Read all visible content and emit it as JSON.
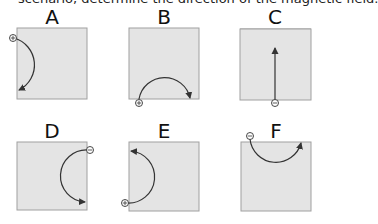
{
  "question": {
    "text_fragment": "scenario, determine the direction of the magnetic field."
  },
  "panels": [
    {
      "label": "A",
      "charge": "+",
      "path": "semicircle",
      "start": "top-left corner",
      "end": "bottom-left",
      "direction": "clockwise arc bulging right, arrow pointing left at bottom"
    },
    {
      "label": "B",
      "charge": "+",
      "path": "semicircle",
      "start": "bottom-left corner",
      "end": "bottom-right",
      "direction": "clockwise arc bulging up, arrow pointing down at right"
    },
    {
      "label": "C",
      "charge": "-",
      "path": "straight line",
      "start": "bottom center",
      "end": "middle top",
      "direction": "straight up"
    },
    {
      "label": "D",
      "charge": "-",
      "path": "semicircle",
      "start": "top-right corner",
      "end": "bottom-right",
      "direction": "counter-clockwise arc bulging left, arrow pointing right at bottom"
    },
    {
      "label": "E",
      "charge": "+",
      "path": "semicircle",
      "start": "bottom-left corner",
      "end": "top-left",
      "direction": "counter-clockwise arc bulging right, arrow pointing left at top"
    },
    {
      "label": "F",
      "charge": "-",
      "path": "semicircle",
      "start": "top-left corner",
      "end": "top-right",
      "direction": "counter-clockwise arc bulging down, arrow pointing up at right"
    }
  ],
  "colors": {
    "box_fill": "#e4e4e4",
    "box_border": "#9a9a9a",
    "path": "#333333",
    "text": "#111111"
  }
}
